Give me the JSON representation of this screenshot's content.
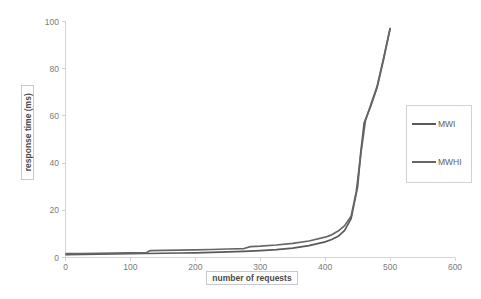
{
  "chart_data": {
    "type": "line",
    "title": "",
    "xlabel": "number of requests",
    "ylabel": "response time (ms)",
    "xlim": [
      0,
      600
    ],
    "ylim": [
      0,
      100
    ],
    "xticks": [
      "0",
      "100",
      "200",
      "300",
      "400",
      "500",
      "600"
    ],
    "yticks": [
      "0",
      "20",
      "40",
      "60",
      "80",
      "100"
    ],
    "grid": false,
    "legend_position": "right",
    "series": [
      {
        "name": "MWI",
        "color": "#595959",
        "x": [
          1,
          25,
          50,
          75,
          100,
          125,
          150,
          175,
          200,
          225,
          250,
          275,
          300,
          325,
          350,
          375,
          400,
          410,
          420,
          430,
          440,
          450,
          455,
          460,
          470,
          480,
          490,
          500
        ],
        "values": [
          1.2,
          1.3,
          1.4,
          1.5,
          1.6,
          1.7,
          1.8,
          1.9,
          2.0,
          2.2,
          2.4,
          2.6,
          2.9,
          3.3,
          4.0,
          5.0,
          6.6,
          7.6,
          9.0,
          11.5,
          16.5,
          30.0,
          45.0,
          57.0,
          64.0,
          72.0,
          84.0,
          97.0
        ]
      },
      {
        "name": "MWHI",
        "color": "#666666",
        "x": [
          1,
          25,
          50,
          75,
          100,
          125,
          130,
          150,
          175,
          200,
          225,
          250,
          275,
          285,
          300,
          325,
          350,
          375,
          400,
          410,
          420,
          430,
          440,
          448,
          455,
          462,
          470,
          480,
          490,
          500
        ],
        "values": [
          1.6,
          1.7,
          1.8,
          1.9,
          2.0,
          2.1,
          2.9,
          3.0,
          3.1,
          3.2,
          3.4,
          3.6,
          3.8,
          4.6,
          4.8,
          5.3,
          6.0,
          7.0,
          8.6,
          9.6,
          11.2,
          13.5,
          17.5,
          28.0,
          44.0,
          58.0,
          64.5,
          72.5,
          84.5,
          97.0
        ]
      }
    ]
  },
  "legend": {
    "entries": [
      {
        "label": "MWI",
        "color": "#595959"
      },
      {
        "label": "MWHI",
        "color": "#666666"
      }
    ]
  }
}
